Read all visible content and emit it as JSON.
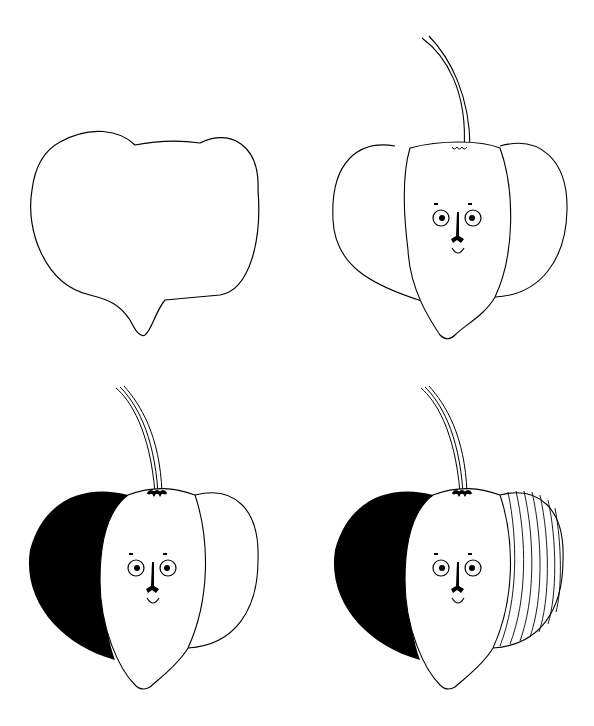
{
  "steps": [
    {
      "index": 1,
      "description": "Outline shape"
    },
    {
      "index": 2,
      "description": "Segments, stem and face"
    },
    {
      "index": 3,
      "description": "Left segment filled black, freckles"
    },
    {
      "index": 4,
      "description": "Right segment striped"
    }
  ],
  "colors": {
    "ink": "#000000",
    "paper": "#ffffff"
  }
}
